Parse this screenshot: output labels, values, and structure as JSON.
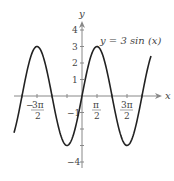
{
  "chart_data": {
    "type": "line",
    "title": "",
    "annotation": "y = 3 sin(x)",
    "function": "y = 3*sin(x)",
    "xlabel": "x",
    "ylabel": "y",
    "xlim": [
      -2.3,
      2.3
    ],
    "xlim_units": "pi",
    "ylim": [
      -4.5,
      4.5
    ],
    "x_ticks": [
      {
        "value": -4.712,
        "label_num": "3π",
        "label_den": "2",
        "sign": "−"
      },
      {
        "value": 1.571,
        "label_num": "π",
        "label_den": "2",
        "sign": ""
      },
      {
        "value": 4.712,
        "label_num": "3π",
        "label_den": "2",
        "sign": ""
      }
    ],
    "y_ticks": [
      {
        "value": 4,
        "label": "4"
      },
      {
        "value": 3,
        "label": "3"
      },
      {
        "value": 2,
        "label": "2"
      },
      {
        "value": 1,
        "label": "1"
      },
      {
        "value": -1,
        "label": "−1"
      },
      {
        "value": -2,
        "label": ""
      },
      {
        "value": -3,
        "label": ""
      },
      {
        "value": -4,
        "label": "−4"
      }
    ],
    "series": [
      {
        "name": "y = 3 sin(x)",
        "amplitude": 3,
        "period": "2π",
        "x": [
          -7.07,
          -6.28,
          -5.5,
          -4.71,
          -3.93,
          -3.14,
          -2.36,
          -1.57,
          -0.79,
          0,
          0.79,
          1.57,
          2.36,
          3.14,
          3.93,
          4.71,
          5.5,
          6.28,
          7.07
        ],
        "values": [
          -2.12,
          0,
          2.12,
          3,
          2.12,
          0,
          -2.12,
          -3,
          -2.12,
          0,
          2.12,
          3,
          2.12,
          0,
          -2.12,
          -3,
          -2.12,
          0,
          2.12
        ]
      }
    ],
    "grid": false,
    "legend": "none"
  },
  "labels": {
    "x_axis": "x",
    "y_axis": "y",
    "equation": "y = 3 sin (x)",
    "tick_neg_3pi2_num": "3π",
    "tick_neg_3pi2_den": "2",
    "tick_neg_sign": "−",
    "tick_pi2_num": "π",
    "tick_pi2_den": "2",
    "tick_3pi2_num": "3π",
    "tick_3pi2_den": "2",
    "y4": "4",
    "y3": "3",
    "y2": "2",
    "y1": "1",
    "yneg1": "−1",
    "yneg4": "−4"
  },
  "colors": {
    "curve": "#222222",
    "axis": "#888888",
    "text": "#444444"
  }
}
